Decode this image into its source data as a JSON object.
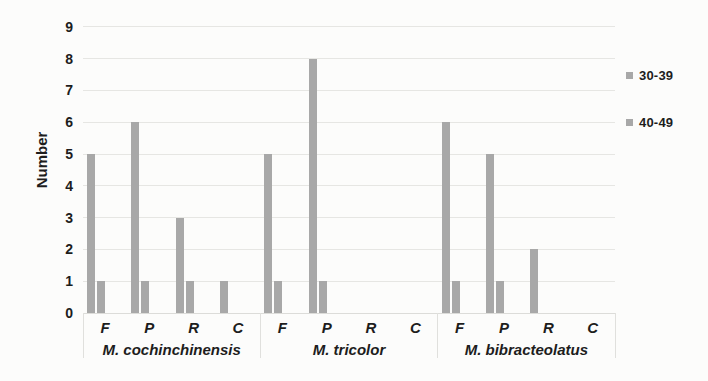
{
  "figure": {
    "background": "#fcfcfb",
    "text_color": "#1d1d1d",
    "gridline_color": "#e6e6e3",
    "bar_color": "#a8a8a8"
  },
  "chart_data": {
    "type": "bar",
    "title": "",
    "xlabel": "",
    "ylabel": "Number",
    "ylim": [
      0,
      9
    ],
    "ytick_step": 1,
    "yticks": [
      0,
      1,
      2,
      3,
      4,
      5,
      6,
      7,
      8,
      9
    ],
    "grid": true,
    "legend_position": "right",
    "groups": [
      "M. cochinchinensis",
      "M. tricolor",
      "M. bibracteolatus"
    ],
    "categories": [
      "F",
      "P",
      "R",
      "C"
    ],
    "series": [
      {
        "name": "30-39",
        "color": "#a8a8a8",
        "values_by_group": [
          [
            5,
            6,
            3,
            1
          ],
          [
            5,
            8,
            0,
            0
          ],
          [
            6,
            5,
            2,
            0
          ]
        ]
      },
      {
        "name": "40-49",
        "color": "#a8a8a8",
        "values_by_group": [
          [
            1,
            1,
            1,
            0
          ],
          [
            1,
            1,
            0,
            0
          ],
          [
            1,
            1,
            0,
            0
          ]
        ]
      }
    ]
  }
}
